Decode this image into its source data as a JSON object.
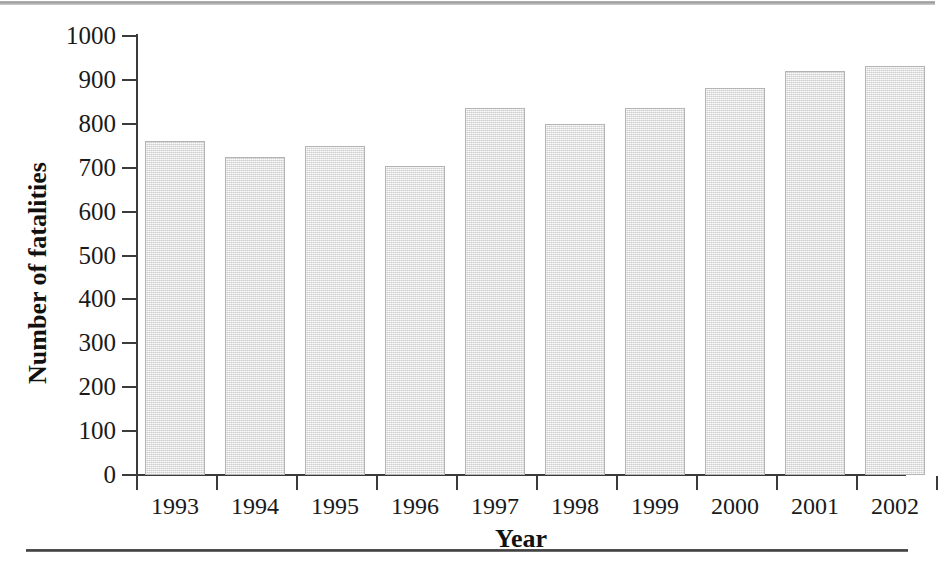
{
  "chart_data": {
    "type": "bar",
    "title": "",
    "xlabel": "Year",
    "ylabel": "Number of fatalities",
    "categories": [
      "1993",
      "1994",
      "1995",
      "1996",
      "1997",
      "1998",
      "1999",
      "2000",
      "2001",
      "2002"
    ],
    "values": [
      760,
      725,
      750,
      705,
      835,
      800,
      835,
      882,
      920,
      932
    ],
    "ylim": [
      0,
      1000
    ],
    "y_ticks": [
      0,
      100,
      200,
      300,
      400,
      500,
      600,
      700,
      800,
      900,
      1000
    ],
    "y_tick_labels": [
      "0",
      "100",
      "200",
      "300",
      "400",
      "500",
      "600",
      "700",
      "800",
      "900",
      "1000"
    ],
    "grid": false,
    "legend": null,
    "series": [
      {
        "name": "Number of fatalities",
        "values": [
          760,
          725,
          750,
          705,
          835,
          800,
          835,
          882,
          920,
          932
        ],
        "color": "#e6e6e6",
        "edge_color": "#b4b4b4"
      }
    ]
  },
  "axes": {
    "y_title": "Number of fatalities",
    "x_title": "Year"
  },
  "colors": {
    "bar_fill": "#e6e6e6",
    "bar_edge": "#b4b4b4",
    "axis": "#3b3b3b",
    "text": "#1a1a1a",
    "rule_bottom": "#3d3d3d",
    "rule_top": "#9d9d9d",
    "background": "#ffffff"
  },
  "rules": {
    "top": "page-rule-top",
    "bottom": "page-rule-bottom"
  }
}
